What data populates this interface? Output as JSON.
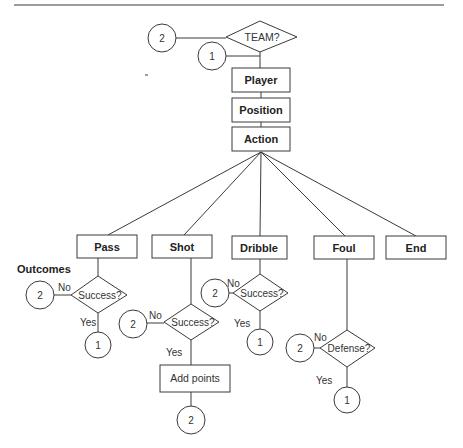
{
  "diagram": {
    "top_decision": {
      "label": "TEAM?",
      "connector_left": "2",
      "connector_back": "1"
    },
    "sequence": [
      {
        "label": "Player"
      },
      {
        "label": "Position"
      },
      {
        "label": "Action"
      }
    ],
    "actions": [
      {
        "label": "Pass"
      },
      {
        "label": "Shot"
      },
      {
        "label": "Dribble"
      },
      {
        "label": "Foul"
      },
      {
        "label": "End"
      }
    ],
    "outcomes_label": "Outcomes",
    "outcomes": {
      "pass": {
        "decision": "Success?",
        "no_label": "No",
        "yes_label": "Yes",
        "no_connector": "2",
        "yes_connector": "1"
      },
      "shot": {
        "decision": "Success?",
        "no_label": "No",
        "yes_label": "Yes",
        "no_connector": "2",
        "yes_step": "Add points",
        "end_connector": "2"
      },
      "dribble": {
        "decision": "Success?",
        "no_label": "No",
        "yes_label": "Yes",
        "no_connector": "2",
        "yes_connector": "1"
      },
      "foul": {
        "decision": "Defense?",
        "no_label": "No",
        "yes_label": "Yes",
        "no_connector": "2",
        "yes_connector": "1"
      }
    },
    "colors": {
      "line": "#3a3a3a",
      "text": "#222222",
      "background": "#ffffff"
    }
  }
}
